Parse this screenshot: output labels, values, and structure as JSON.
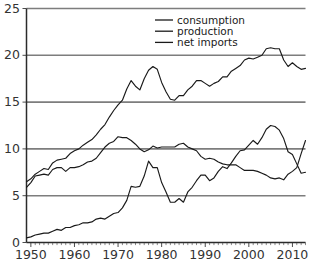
{
  "chart_data": {
    "type": "line",
    "title": "",
    "xlabel": "",
    "ylabel": "",
    "xlim": [
      1949,
      2013
    ],
    "ylim": [
      0,
      25
    ],
    "grid": true,
    "gridlines_y": [
      0,
      5,
      10,
      15,
      20,
      25
    ],
    "legend_position": "top-center",
    "y_ticks": [
      "0",
      "5",
      "10",
      "15",
      "20",
      "25"
    ],
    "y_tick_values": [
      0,
      5,
      10,
      15,
      20,
      25
    ],
    "x_ticks": [
      "1950",
      "1960",
      "1970",
      "1980",
      "1990",
      "2000",
      "2010"
    ],
    "x_tick_values": [
      1950,
      1960,
      1970,
      1980,
      1990,
      2000,
      2010
    ],
    "x_minor_tick_step": 1,
    "x": [
      1949,
      1950,
      1951,
      1952,
      1953,
      1954,
      1955,
      1956,
      1957,
      1958,
      1959,
      1960,
      1961,
      1962,
      1963,
      1964,
      1965,
      1966,
      1967,
      1968,
      1969,
      1970,
      1971,
      1972,
      1973,
      1974,
      1975,
      1976,
      1977,
      1978,
      1979,
      1980,
      1981,
      1982,
      1983,
      1984,
      1985,
      1986,
      1987,
      1988,
      1989,
      1990,
      1991,
      1992,
      1993,
      1994,
      1995,
      1996,
      1997,
      1998,
      1999,
      2000,
      2001,
      2002,
      2003,
      2004,
      2005,
      2006,
      2007,
      2008,
      2009,
      2010,
      2011,
      2012,
      2013
    ],
    "series": [
      {
        "name": "consumption",
        "color": "#1a1a1a",
        "values": [
          6.5,
          6.8,
          7.3,
          7.6,
          7.9,
          7.8,
          8.5,
          8.8,
          8.9,
          9.0,
          9.5,
          9.8,
          10.0,
          10.4,
          10.7,
          11.0,
          11.5,
          12.1,
          12.6,
          13.4,
          14.1,
          14.7,
          15.2,
          16.4,
          17.3,
          16.7,
          16.3,
          17.5,
          18.4,
          18.8,
          18.5,
          17.1,
          16.1,
          15.3,
          15.2,
          15.7,
          15.7,
          16.3,
          16.7,
          17.3,
          17.3,
          17.0,
          16.7,
          17.0,
          17.2,
          17.7,
          17.7,
          18.3,
          18.6,
          18.9,
          19.5,
          19.7,
          19.6,
          19.8,
          20.0,
          20.7,
          20.8,
          20.7,
          20.7,
          19.5,
          18.8,
          19.2,
          18.8,
          18.5,
          18.6
        ],
        "note": "million barrels per day"
      },
      {
        "name": "production",
        "color": "#1a1a1a",
        "values": [
          5.9,
          6.4,
          7.1,
          7.2,
          7.3,
          7.2,
          7.8,
          8.0,
          8.0,
          7.6,
          8.0,
          8.0,
          8.1,
          8.3,
          8.6,
          8.7,
          9.0,
          9.6,
          10.2,
          10.6,
          10.8,
          11.3,
          11.2,
          11.2,
          10.9,
          10.5,
          10.0,
          9.7,
          9.9,
          10.3,
          10.1,
          10.2,
          10.2,
          10.2,
          10.2,
          10.5,
          10.6,
          10.2,
          10.0,
          9.8,
          9.2,
          8.9,
          9.0,
          8.9,
          8.6,
          8.4,
          8.3,
          8.3,
          8.3,
          8.0,
          7.7,
          7.7,
          7.7,
          7.6,
          7.4,
          7.2,
          6.9,
          6.8,
          6.9,
          6.7,
          7.3,
          7.6,
          8.0,
          9.5,
          10.9
        ],
        "note": "million barrels per day"
      },
      {
        "name": "net imports",
        "color": "#1a1a1a",
        "values": [
          0.5,
          0.6,
          0.8,
          0.9,
          1.0,
          1.0,
          1.2,
          1.4,
          1.3,
          1.6,
          1.6,
          1.8,
          1.9,
          2.1,
          2.1,
          2.2,
          2.5,
          2.6,
          2.5,
          2.8,
          3.1,
          3.2,
          3.7,
          4.5,
          6.0,
          5.9,
          6.0,
          7.1,
          8.7,
          8.0,
          8.0,
          6.4,
          5.4,
          4.3,
          4.3,
          4.7,
          4.3,
          5.4,
          5.9,
          6.6,
          7.2,
          7.2,
          6.6,
          6.9,
          7.6,
          8.1,
          7.9,
          8.5,
          9.2,
          9.8,
          9.9,
          10.4,
          10.9,
          10.5,
          11.2,
          12.1,
          12.5,
          12.4,
          12.0,
          11.1,
          9.7,
          9.4,
          8.4,
          7.4,
          7.5
        ],
        "note": "million barrels per day"
      }
    ]
  },
  "legend": {
    "items": [
      {
        "label": "consumption"
      },
      {
        "label": "production"
      },
      {
        "label": "net imports"
      }
    ]
  },
  "colors": {
    "background": "#ffffff",
    "line": "#1a1a1a",
    "gridline": "#7d7d7d",
    "axis": "#2b2b2b",
    "text": "#333333"
  }
}
